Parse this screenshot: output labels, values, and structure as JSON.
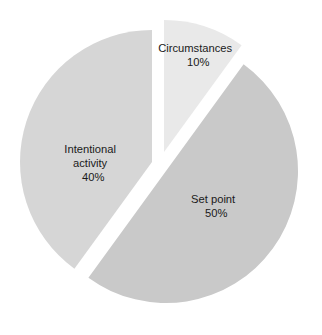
{
  "chart_data": {
    "type": "pie",
    "title": "",
    "subtitle": "",
    "xlabel": "",
    "ylabel": "",
    "legend_position": "none",
    "grid": false,
    "background_color": "#ffffff",
    "label_color": "#1a1a1a",
    "categories": [
      "Circumstances",
      "Set point",
      "Intentional activity"
    ],
    "values": [
      10,
      50,
      40
    ],
    "value_suffix": "%",
    "slices": [
      {
        "name": "Circumstances",
        "label_line1": "Circumstances",
        "label_line2": "10%",
        "value": 10,
        "percent_text": "10%",
        "color": "#e9e9e9",
        "start_angle_deg": 0,
        "end_angle_deg": 36,
        "exploded": true,
        "label_x": 206,
        "label_y": 52
      },
      {
        "name": "Set point",
        "label_line1": "Set point",
        "label_line2": "50%",
        "value": 50,
        "percent_text": "50%",
        "color": "#c9c9c9",
        "start_angle_deg": 36,
        "end_angle_deg": 216,
        "exploded": true,
        "label_x": 224,
        "label_y": 203
      },
      {
        "name": "Intentional activity",
        "label_line1": "Intentional",
        "label_line2": "activity",
        "label_line3": "40%",
        "value": 40,
        "percent_text": "40%",
        "color": "#d6d6d6",
        "start_angle_deg": 216,
        "end_angle_deg": 360,
        "exploded": false,
        "label_x": 101,
        "label_y": 153
      }
    ],
    "geometry": {
      "center_x": 152,
      "center_y": 162,
      "radius": 132,
      "explode_circumstances_x": 12,
      "explode_circumstances_y": -10,
      "explode_setpoint_x": 14,
      "explode_setpoint_y": 9
    }
  }
}
